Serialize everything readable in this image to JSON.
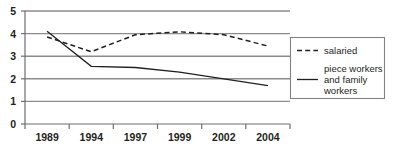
{
  "chart_data": {
    "type": "line",
    "title": "",
    "subtitle": "",
    "xlabel": "",
    "ylabel": "",
    "categories": [
      "1989",
      "1994",
      "1997",
      "1999",
      "2002",
      "2004"
    ],
    "x": [
      1989,
      1994,
      1997,
      1999,
      2002,
      2004
    ],
    "ylim": [
      0,
      5
    ],
    "xlim_categories": [
      0,
      5
    ],
    "yticks": [
      "0",
      "1",
      "2",
      "3",
      "4",
      "5"
    ],
    "ytick_values": [
      0,
      1,
      2,
      3,
      4,
      5
    ],
    "grid": "horizontal",
    "legend_position": "right",
    "series": [
      {
        "name": "salaried",
        "style": "dashed",
        "color": "#231f20",
        "values": [
          3.85,
          3.2,
          3.95,
          4.08,
          3.95,
          3.45
        ]
      },
      {
        "name": "piece workers and family workers",
        "style": "solid",
        "color": "#231f20",
        "values": [
          4.1,
          2.55,
          2.5,
          2.3,
          2.0,
          1.7
        ]
      }
    ]
  },
  "axis": {
    "y_tick_labels": [
      "5",
      "4",
      "3",
      "2",
      "1",
      "0"
    ],
    "x_tick_labels": [
      "1989",
      "1994",
      "1997",
      "1999",
      "2002",
      "2004"
    ]
  },
  "legend": {
    "entries": [
      {
        "label": "salaried",
        "label_lines": [
          "salaried"
        ],
        "swatch": "dashed-line-swatch"
      },
      {
        "label": "piece workers and family workers",
        "label_lines": [
          "piece workers",
          "and family",
          "workers"
        ],
        "swatch": "solid-line-swatch"
      }
    ]
  },
  "colors": {
    "line": "#231f20",
    "grid": "#8c8c8c",
    "axis": "#6d6e71",
    "legend_border": "#808285",
    "background": "#ffffff"
  }
}
